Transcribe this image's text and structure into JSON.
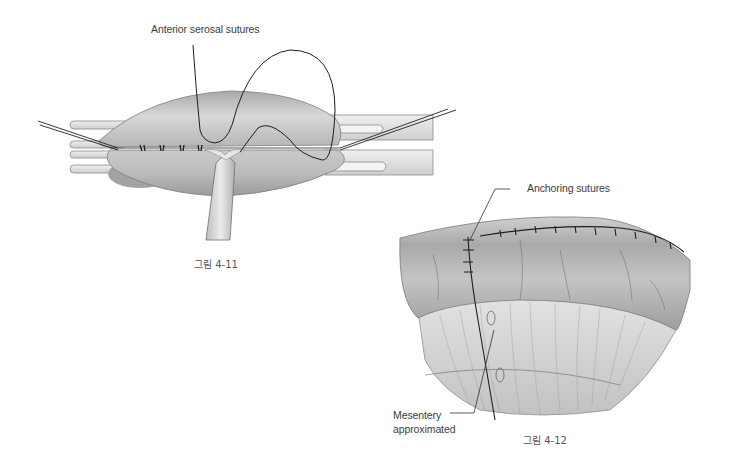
{
  "figure_4_11": {
    "label_anterior": "Anterior serosal sutures",
    "caption": "그림 4-11"
  },
  "figure_4_12": {
    "label_anchoring": "Anchoring sutures",
    "label_mesentery_line1": "Mesentery",
    "label_mesentery_line2": "approximated",
    "caption": "그림 4-12"
  },
  "colors": {
    "background": "#ffffff",
    "tissue_light": "#d9d9d9",
    "tissue_mid": "#b8b8b8",
    "tissue_dark": "#8c8c8c",
    "suture": "#1e1e1e",
    "label_text": "#3c3c3c"
  }
}
